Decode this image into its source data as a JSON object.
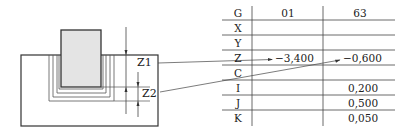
{
  "diagram": {
    "labels": {
      "z1": "Z1",
      "z2": "Z2"
    },
    "colors": {
      "electrode_fill": "#e4e4e4",
      "line": "#333333"
    }
  },
  "table": {
    "headers": {
      "g": "G",
      "col1": "01",
      "col2": "63"
    },
    "rows": [
      {
        "code": "X",
        "col1": "",
        "col2": ""
      },
      {
        "code": "Y",
        "col1": "",
        "col2": ""
      },
      {
        "code": "Z",
        "col1": "−3,400",
        "col2": "−0,600"
      },
      {
        "code": "C",
        "col1": "",
        "col2": ""
      },
      {
        "code": "I",
        "col1": "",
        "col2": "0,200"
      },
      {
        "code": "J",
        "col1": "",
        "col2": "0,500"
      },
      {
        "code": "K",
        "col1": "",
        "col2": "0,050"
      }
    ]
  }
}
